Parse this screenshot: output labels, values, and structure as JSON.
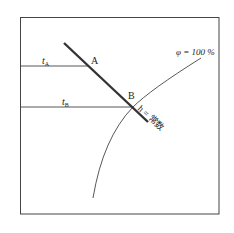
{
  "diagram": {
    "title": "",
    "frame": {
      "x": 20,
      "y": 17,
      "w": 199,
      "h": 197
    },
    "colors": {
      "stroke": "#333333",
      "thick": "#333333",
      "background": "#ffffff"
    },
    "labels": {
      "tA_main": "t",
      "tA_sub": "A",
      "tB_main": "t",
      "tB_sub": "B",
      "point_a": "A",
      "point_b": "B",
      "phi_curve": "φ = 100 %",
      "h_line": "h = 常数"
    },
    "elements": {
      "h_constant_line": {
        "x1": 64,
        "y1": 43,
        "x2": 148,
        "y2": 122,
        "label": "h = 常数"
      },
      "tA_line": {
        "x1": 20,
        "y1": 66,
        "x2": 88,
        "y2": 66,
        "label": "tA"
      },
      "tB_line": {
        "x1": 20,
        "y1": 107,
        "x2": 133,
        "y2": 107,
        "label": "tB"
      },
      "saturation_curve": {
        "label": "φ = 100 %",
        "path": "M201,58 Q150,95 133,107 Q100,140 93,198"
      },
      "points": [
        {
          "name": "A",
          "x": 88,
          "y": 66
        },
        {
          "name": "B",
          "x": 133,
          "y": 107
        }
      ]
    }
  }
}
